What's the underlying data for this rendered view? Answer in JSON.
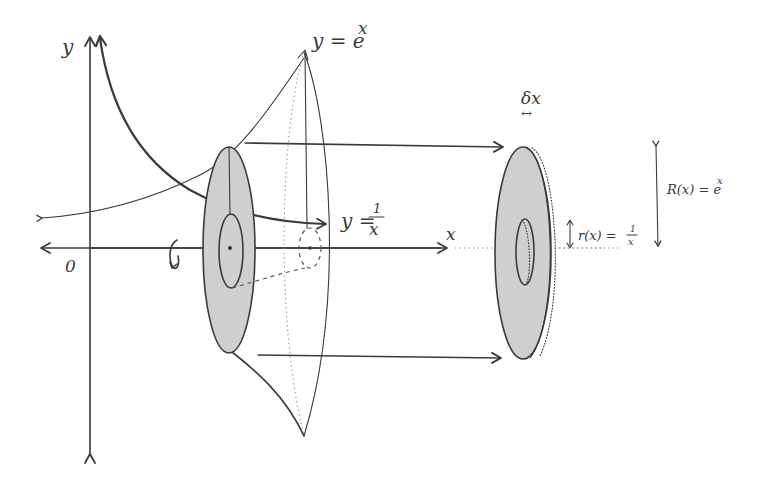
{
  "diagram": {
    "axes": {
      "y_label": "y",
      "x_label": "x",
      "origin_label": "0"
    },
    "curves": {
      "exp_label": "y = e",
      "exp_superscript": "x",
      "recip_label_prefix": "y =",
      "recip_numerator": "1",
      "recip_denominator": "x"
    },
    "washer": {
      "thickness_label": "δx",
      "thickness_arrow_glyph": "↔",
      "inner_radius_label": "r(x) = ",
      "inner_radius_numerator": "1",
      "inner_radius_denominator": "x",
      "outer_radius_label": "R(x) = e",
      "outer_radius_superscript": "x"
    },
    "rotation_icon": "rotation-arrow-icon",
    "colors": {
      "ink": "#3a3a3a",
      "shade": "#cfcfcf",
      "dotted": "#9a9a9a",
      "background": "#ffffff"
    }
  }
}
